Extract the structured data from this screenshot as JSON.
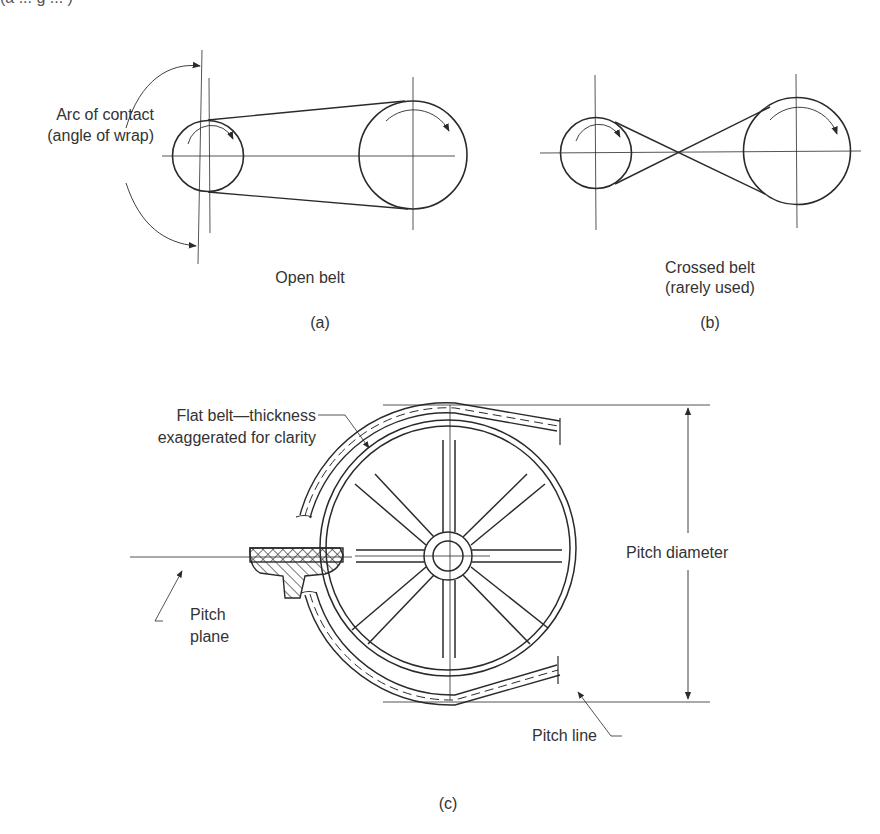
{
  "header_fragment": "(a ... g ... )",
  "panels": {
    "a": {
      "caption": "Open belt",
      "tag": "(a)",
      "arc_label_line1": "Arc of contact",
      "arc_label_line2": "(angle of wrap)"
    },
    "b": {
      "caption_line1": "Crossed belt",
      "caption_line2": "(rarely used)",
      "tag": "(b)"
    },
    "c": {
      "belt_label_line1": "Flat belt—thickness",
      "belt_label_line2": "exaggerated for clarity",
      "pitch_plane_line1": "Pitch",
      "pitch_plane_line2": "plane",
      "pitch_diameter": "Pitch diameter",
      "pitch_line": "Pitch line",
      "tag": "(c)"
    }
  },
  "colors": {
    "ink": "#2a2a2a",
    "background": "#ffffff"
  }
}
